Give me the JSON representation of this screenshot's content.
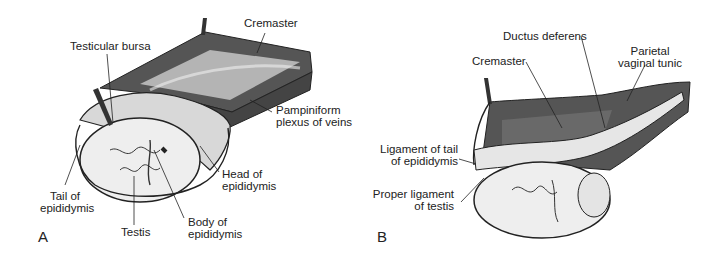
{
  "figure": {
    "panels": [
      {
        "letter": "A",
        "labels": {
          "cremaster": "Cremaster",
          "testicular_bursa": "Testicular bursa",
          "pampiniform_1": "Pampiniform",
          "pampiniform_2": "plexus of veins",
          "head_1": "Head of",
          "head_2": "epididymis",
          "tail_1": "Tail of",
          "tail_2": "epididymis",
          "testis": "Testis",
          "body_1": "Body of",
          "body_2": "epididymis"
        }
      },
      {
        "letter": "B",
        "labels": {
          "ductus": "Ductus deferens",
          "cremaster": "Cremaster",
          "parietal_1": "Parietal",
          "parietal_2": "vaginal tunic",
          "lig_tail_1": "Ligament of tail",
          "lig_tail_2": "of epididymis",
          "proper_1": "Proper ligament",
          "proper_2": "of testis"
        }
      }
    ]
  }
}
